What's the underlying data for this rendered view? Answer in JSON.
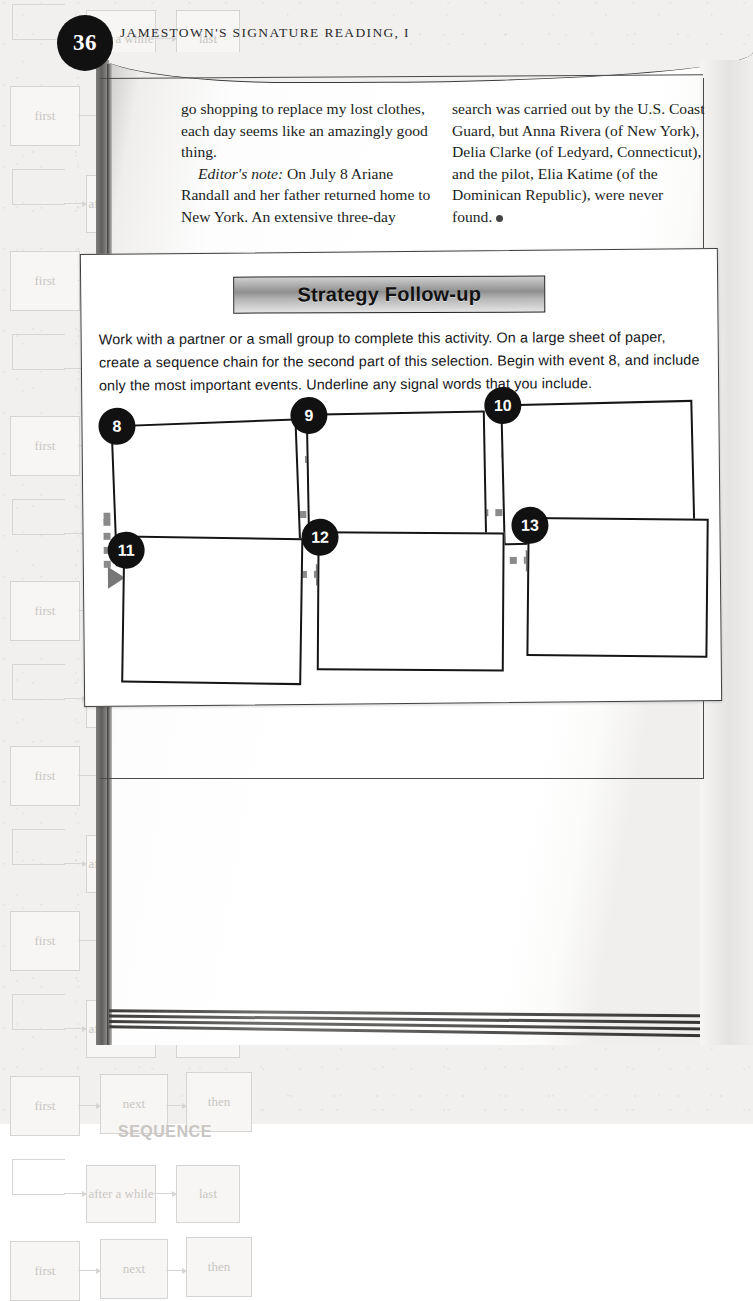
{
  "page": {
    "number": "36",
    "running_head": "JAMESTOWN'S SIGNATURE READING, I"
  },
  "article": {
    "left_column": [
      "go shopping to replace my lost clothes, each day seems like an amazingly good thing.",
      "Editor's note: On July 8 Ariane Randall and her father returned home to New York. An extensive three-day"
    ],
    "left_column_italic": "Editor's note:",
    "left_column_after_italic": " On July 8 Ariane Randall and her father returned home to New York. An extensive three-day",
    "right_column": "search was carried out by the U.S. Coast Guard, but Anna Rivera (of New York), Delia Clarke (of Ledyard, Connecticut), and the pilot, Elia Katime (of the Dominican Republic), were never found."
  },
  "activity": {
    "banner_title": "Strategy Follow-up",
    "instructions": "Work with a partner or a small group to complete this activity. On a large sheet of paper, create a sequence chain for the second part of this selection. Begin with event 8, and include only the most important events. Underline any signal words that you include.",
    "events": [
      {
        "number": "8",
        "row": 1
      },
      {
        "number": "9",
        "row": 1
      },
      {
        "number": "10",
        "row": 1
      },
      {
        "number": "11",
        "row": 2
      },
      {
        "number": "12",
        "row": 2
      },
      {
        "number": "13",
        "row": 2
      }
    ]
  },
  "decoration": {
    "motif_labels": [
      "first",
      "next",
      "then",
      "after a while",
      "last"
    ],
    "motif_heading": "SEQUENCE",
    "colors": {
      "ink": "#151515",
      "connector_gray": "#8a8a8a",
      "banner_dark": "#8f8f8f",
      "motif_gray": "#c8c5c2"
    }
  }
}
